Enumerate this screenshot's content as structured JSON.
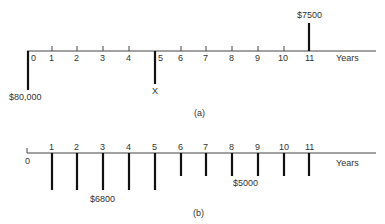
{
  "diagram_a": {
    "caption": "(a)",
    "axis_label": "Years",
    "ticks": [
      "0",
      "1",
      "2",
      "3",
      "4",
      "5",
      "6",
      "7",
      "8",
      "9",
      "10",
      "11"
    ],
    "flows": [
      {
        "year": 0,
        "direction": "down",
        "label": "$80,000"
      },
      {
        "year": 5,
        "direction": "down",
        "label": "X"
      },
      {
        "year": 11,
        "direction": "up",
        "label": "$7500"
      }
    ]
  },
  "diagram_b": {
    "caption": "(b)",
    "axis_label": "Years",
    "ticks": [
      "0",
      "1",
      "2",
      "3",
      "4",
      "5",
      "6",
      "7",
      "8",
      "9",
      "10",
      "11"
    ],
    "flows": [
      {
        "year": 1,
        "direction": "down",
        "size": "large"
      },
      {
        "year": 2,
        "direction": "down",
        "size": "large"
      },
      {
        "year": 3,
        "direction": "down",
        "size": "large",
        "label": "$6800"
      },
      {
        "year": 4,
        "direction": "down",
        "size": "large"
      },
      {
        "year": 5,
        "direction": "down",
        "size": "large"
      },
      {
        "year": 6,
        "direction": "down",
        "size": "small"
      },
      {
        "year": 7,
        "direction": "down",
        "size": "small"
      },
      {
        "year": 8,
        "direction": "down",
        "size": "small",
        "label": "$5000"
      },
      {
        "year": 9,
        "direction": "down",
        "size": "small"
      },
      {
        "year": 10,
        "direction": "down",
        "size": "small"
      },
      {
        "year": 11,
        "direction": "down",
        "size": "small"
      }
    ]
  }
}
